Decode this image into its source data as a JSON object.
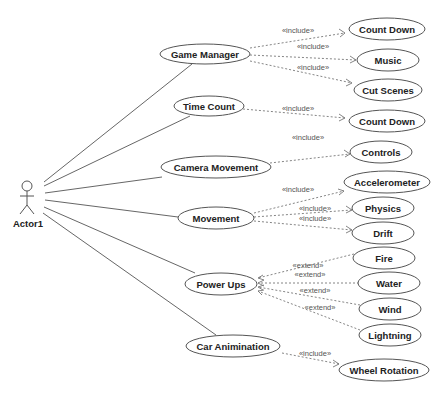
{
  "diagram": {
    "type": "uml-use-case",
    "actor": {
      "label": "Actor1"
    },
    "use_cases": {
      "game_manager": "Game Manager",
      "time_count": "Time Count",
      "camera_movement": "Camera Movement",
      "movement": "Movement",
      "power_ups": "Power Ups",
      "car_animination": "Car Animination",
      "count_down_1": "Count Down",
      "music": "Music",
      "cut_scenes": "Cut Scenes",
      "count_down_2": "Count Down",
      "controls": "Controls",
      "accelerometer": "Accelerometer",
      "physics": "Physics",
      "drift": "Drift",
      "fire": "Fire",
      "water": "Water",
      "wind": "Wind",
      "lightning": "Lightning",
      "wheel_rotation": "Wheel Rotation"
    },
    "stereotypes": {
      "include": "«include»",
      "extend": "«extend»"
    },
    "relationships": [
      {
        "from": "Actor1",
        "to": "Game Manager",
        "type": "association"
      },
      {
        "from": "Actor1",
        "to": "Time Count",
        "type": "association"
      },
      {
        "from": "Actor1",
        "to": "Camera Movement",
        "type": "association"
      },
      {
        "from": "Actor1",
        "to": "Movement",
        "type": "association"
      },
      {
        "from": "Actor1",
        "to": "Power Ups",
        "type": "association"
      },
      {
        "from": "Actor1",
        "to": "Car Animination",
        "type": "association"
      },
      {
        "from": "Game Manager",
        "to": "Count Down",
        "type": "include"
      },
      {
        "from": "Game Manager",
        "to": "Music",
        "type": "include"
      },
      {
        "from": "Game Manager",
        "to": "Cut Scenes",
        "type": "include"
      },
      {
        "from": "Time Count",
        "to": "Count Down",
        "type": "include"
      },
      {
        "from": "Camera Movement",
        "to": "Controls",
        "type": "include"
      },
      {
        "from": "Movement",
        "to": "Accelerometer",
        "type": "include"
      },
      {
        "from": "Movement",
        "to": "Physics",
        "type": "include"
      },
      {
        "from": "Movement",
        "to": "Drift",
        "type": "include"
      },
      {
        "from": "Fire",
        "to": "Power Ups",
        "type": "extend"
      },
      {
        "from": "Water",
        "to": "Power Ups",
        "type": "extend"
      },
      {
        "from": "Wind",
        "to": "Power Ups",
        "type": "extend"
      },
      {
        "from": "Lightning",
        "to": "Power Ups",
        "type": "extend"
      },
      {
        "from": "Car Animination",
        "to": "Wheel Rotation",
        "type": "include"
      }
    ]
  }
}
